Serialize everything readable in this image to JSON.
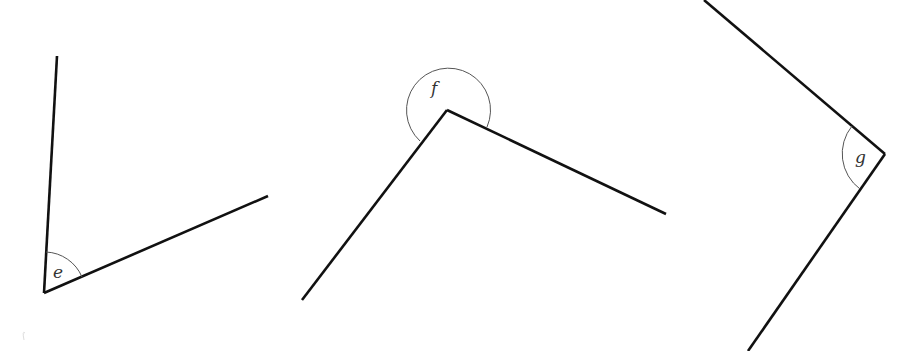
{
  "diagram": {
    "type": "angles",
    "angles": [
      {
        "label": "e",
        "kind": "acute",
        "vertex": [
          44,
          293
        ],
        "ray_ends": [
          [
            57,
            56
          ],
          [
            268,
            196
          ]
        ]
      },
      {
        "label": "f",
        "kind": "reflex",
        "vertex": [
          447,
          110
        ],
        "ray_ends": [
          [
            302,
            300
          ],
          [
            666,
            214
          ]
        ]
      },
      {
        "label": "g",
        "kind": "acute",
        "vertex": [
          885,
          154
        ],
        "ray_ends": [
          [
            704,
            0
          ],
          [
            748,
            351
          ]
        ]
      }
    ]
  }
}
